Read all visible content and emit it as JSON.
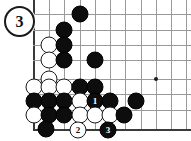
{
  "figure": {
    "label": "3",
    "badge_name": "figure-number-badge"
  },
  "board": {
    "type": "go-board-corner-diagram",
    "corner": "bottom-left",
    "grid": {
      "columns_x": [
        34,
        49,
        64,
        80,
        95,
        110,
        125,
        141,
        156,
        171,
        186
      ],
      "rows_y": [
        14,
        30,
        45,
        60,
        79,
        94,
        110,
        130
      ],
      "left_edge_x": 34,
      "bottom_edge_y": 130,
      "line_color": "#9a9a9a",
      "edge_color": "#3a3a3a"
    },
    "star_points": [
      {
        "col": 8,
        "row": 4,
        "x": 156,
        "y": 79
      }
    ],
    "stones": [
      {
        "color": "black",
        "col": 3,
        "row": 0,
        "x": 80,
        "y": 14,
        "label": ""
      },
      {
        "color": "black",
        "col": 2,
        "row": 1,
        "x": 64,
        "y": 30,
        "label": ""
      },
      {
        "color": "white",
        "col": 1,
        "row": 2,
        "x": 49,
        "y": 45,
        "label": ""
      },
      {
        "color": "black",
        "col": 2,
        "row": 2,
        "x": 64,
        "y": 45,
        "label": ""
      },
      {
        "color": "white",
        "col": 1,
        "row": 3,
        "x": 49,
        "y": 60,
        "label": ""
      },
      {
        "color": "black",
        "col": 2,
        "row": 3,
        "x": 64,
        "y": 60,
        "label": ""
      },
      {
        "color": "black",
        "col": 4,
        "row": 3,
        "x": 95,
        "y": 60,
        "label": ""
      },
      {
        "color": "white",
        "col": 1,
        "row": 4,
        "x": 49,
        "y": 79,
        "label": ""
      },
      {
        "color": "white",
        "col": 0,
        "row": 5,
        "x": 34,
        "y": 87,
        "label": ""
      },
      {
        "color": "white",
        "col": 1,
        "row": 5,
        "x": 49,
        "y": 87,
        "label": ""
      },
      {
        "color": "white",
        "col": 2,
        "row": 5,
        "x": 64,
        "y": 87,
        "label": ""
      },
      {
        "color": "black",
        "col": 3,
        "row": 5,
        "x": 80,
        "y": 87,
        "label": ""
      },
      {
        "color": "black",
        "col": 4,
        "row": 5,
        "x": 95,
        "y": 87,
        "label": ""
      },
      {
        "color": "black",
        "col": 0,
        "row": 6,
        "x": 34,
        "y": 101,
        "label": ""
      },
      {
        "color": "black",
        "col": 1,
        "row": 6,
        "x": 49,
        "y": 101,
        "label": ""
      },
      {
        "color": "black",
        "col": 2,
        "row": 6,
        "x": 64,
        "y": 101,
        "label": ""
      },
      {
        "color": "white",
        "col": 3,
        "row": 6,
        "x": 80,
        "y": 101,
        "label": ""
      },
      {
        "color": "black",
        "col": 4,
        "row": 6,
        "x": 95,
        "y": 101,
        "label": "1"
      },
      {
        "color": "black",
        "col": 5,
        "row": 6,
        "x": 110,
        "y": 101,
        "label": ""
      },
      {
        "color": "black",
        "col": 7,
        "row": 6,
        "x": 136,
        "y": 101,
        "label": ""
      },
      {
        "color": "white",
        "col": 0,
        "row": 7,
        "x": 34,
        "y": 115,
        "label": ""
      },
      {
        "color": "black",
        "col": 1,
        "row": 7,
        "x": 49,
        "y": 115,
        "label": ""
      },
      {
        "color": "black",
        "col": 2,
        "row": 7,
        "x": 64,
        "y": 115,
        "label": ""
      },
      {
        "color": "white",
        "col": 3,
        "row": 7,
        "x": 80,
        "y": 115,
        "label": ""
      },
      {
        "color": "white",
        "col": 4,
        "row": 7,
        "x": 95,
        "y": 115,
        "label": ""
      },
      {
        "color": "white",
        "col": 5,
        "row": 7,
        "x": 110,
        "y": 115,
        "label": ""
      },
      {
        "color": "black",
        "col": 6,
        "row": 7,
        "x": 124,
        "y": 115,
        "label": ""
      },
      {
        "color": "black",
        "col": 1,
        "row": 8,
        "x": 46,
        "y": 129,
        "label": ""
      },
      {
        "color": "white",
        "col": 3,
        "row": 8,
        "x": 78,
        "y": 130,
        "label": "2"
      },
      {
        "color": "black",
        "col": 5,
        "row": 8,
        "x": 108,
        "y": 130,
        "label": "3"
      }
    ]
  }
}
